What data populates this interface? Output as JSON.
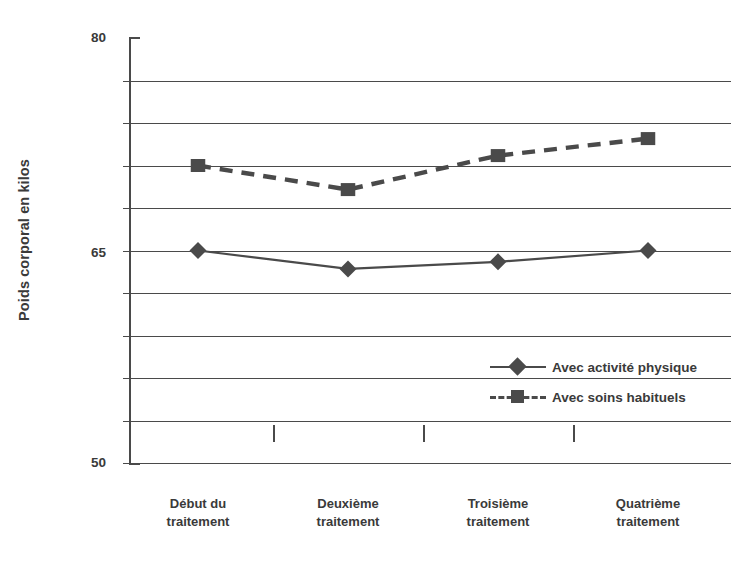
{
  "chart_data": {
    "type": "line",
    "title": "",
    "xlabel": "",
    "ylabel": "Poids corporal en kilos",
    "ylim": [
      50,
      80
    ],
    "ytick_labels": [
      "80",
      "65",
      "50"
    ],
    "ytick_values": [
      80,
      65,
      50
    ],
    "gridlines": [
      77,
      74,
      71,
      68,
      65,
      62,
      59,
      56,
      53,
      50
    ],
    "grid": true,
    "legend_position": "inside-lower-right",
    "categories": [
      "Début du\ntraitement",
      "Deuxième\ntraitement",
      "Troisième\ntraitement",
      "Quatrième\ntraitement"
    ],
    "category_lines": [
      [
        "Début du",
        "traitement"
      ],
      [
        "Deuxième",
        "traitement"
      ],
      [
        "Troisième",
        "traitement"
      ],
      [
        "Quatrième",
        "traitement"
      ]
    ],
    "series": [
      {
        "name": "Avec activité physique",
        "marker": "diamond",
        "linestyle": "solid",
        "color": "#4a4a4a",
        "values": [
          65.0,
          63.7,
          64.2,
          65.0
        ]
      },
      {
        "name": "Avec soins habituels",
        "marker": "square",
        "linestyle": "dashed",
        "color": "#4a4a4a",
        "values": [
          71.0,
          69.3,
          71.7,
          72.9
        ]
      }
    ]
  },
  "axis": {
    "y_title": "Poids corporal en kilos",
    "y_top_label": "80",
    "y_mid_label": "65",
    "y_bottom_label": "50"
  },
  "legend": {
    "items": [
      {
        "label": "Avec activité physique",
        "marker": "diamond",
        "linestyle": "solid"
      },
      {
        "label": "Avec soins habituels",
        "marker": "square",
        "linestyle": "dashed"
      }
    ]
  },
  "colors": {
    "ink": "#4a4a4a",
    "text": "#3a3a3a",
    "background": "#ffffff"
  }
}
